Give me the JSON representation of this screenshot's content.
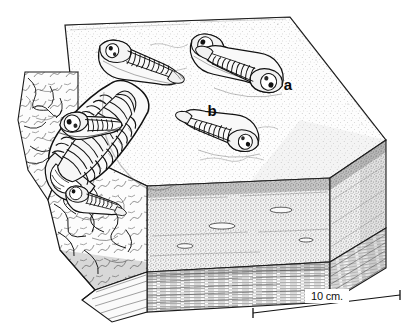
{
  "figure": {
    "kind": "scientific line drawing",
    "ink_color": "#111111",
    "background_color": "#ffffff",
    "paper_tone": "#fdfdfd"
  },
  "labels": {
    "specimen_a": "a",
    "specimen_b": "b"
  },
  "scale_bar": {
    "text": "10 cm.",
    "value": 10,
    "unit": "cm",
    "x1": 253,
    "y1": 313,
    "x2": 400,
    "y2": 295
  },
  "block": {
    "description": "rectangular rock block in oblique view with exposed upper bedding surface, stippled middle bed and finely laminated lower bed",
    "top_surface_tone": "#fbfbfb",
    "front_face_tone": "#f2f2f2",
    "right_face_tone": "#ededed",
    "basal_lamination_tone": "#f6f6f6",
    "broken_edge_note": "irregular fractured left margin exposing fossils in section"
  },
  "strata": [
    {
      "name": "upper bedding plane",
      "texture": "fine stipple"
    },
    {
      "name": "middle bed",
      "texture": "dense stipple with small lenticular bodies"
    },
    {
      "name": "lower bed",
      "texture": "fine horizontal lamination"
    }
  ],
  "trilobites": [
    {
      "id": "t1",
      "position": "upper left of bedding plane",
      "orientation": "cephalon left, pygidium right-down",
      "label": "",
      "size": "medium"
    },
    {
      "id": "t2",
      "position": "upper right of bedding plane",
      "orientation": "cephalon left, pygidium right",
      "label": "",
      "size": "medium"
    },
    {
      "id": "a",
      "position": "right centre of bedding plane",
      "orientation": "cephalon right, pygidium left-up",
      "label": "a",
      "size": "medium"
    },
    {
      "id": "b",
      "position": "centre-left, large specimen",
      "orientation": "cephalon lower right, pygidium upper left",
      "label": "b",
      "size": "large"
    },
    {
      "id": "t5",
      "position": "lower right of bedding plane",
      "orientation": "cephalon right, pygidium left",
      "label": "",
      "size": "medium"
    },
    {
      "id": "t6",
      "position": "left broken edge, upper",
      "orientation": "partly buried, in section",
      "label": "",
      "size": "medium"
    },
    {
      "id": "t7",
      "position": "left broken edge, lower",
      "orientation": "protruding from fractured face",
      "label": "",
      "size": "small"
    }
  ]
}
